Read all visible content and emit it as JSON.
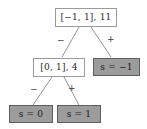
{
  "diagram": {
    "type": "binary-decision-tree",
    "title": "",
    "colors": {
      "leaf_fill": "#9c9c9c",
      "leaf_border": "#5e5e5e",
      "internal_fill": "#ffffff",
      "internal_border": "#9a9a9a",
      "edge_stroke": "#8a8a8a",
      "text": "#2b2b2b",
      "background": "#ffffff"
    },
    "nodes": {
      "root": {
        "label": "[−1, 1], 11",
        "interval": "[−1, 1]",
        "count": "11",
        "kind": "internal"
      },
      "left_child": {
        "label": "[0, 1], 4",
        "interval": "[0, 1]",
        "count": "4",
        "kind": "internal"
      },
      "right_child": {
        "label": "s = −1",
        "kind": "leaf"
      },
      "left_leaf": {
        "label": "s = 0",
        "kind": "leaf"
      },
      "right_leaf": {
        "label": "s = 1",
        "kind": "leaf"
      }
    },
    "edges": {
      "root_left": "−",
      "root_right": "+",
      "child_left": "−",
      "child_right": "+"
    }
  }
}
